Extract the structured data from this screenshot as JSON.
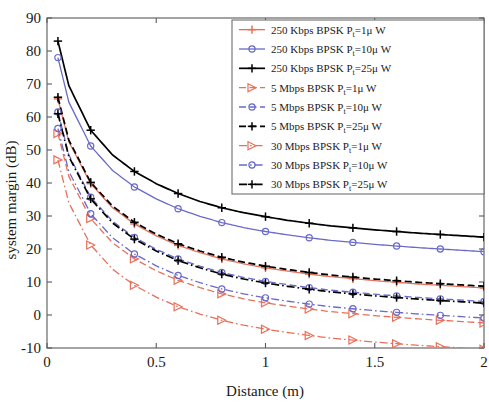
{
  "chart_data": {
    "type": "line",
    "title": "",
    "xlabel": "Distance (m)",
    "ylabel": "system margin (dB)",
    "xlim": [
      0,
      2
    ],
    "ylim": [
      -10,
      90
    ],
    "xticks": [
      0,
      0.5,
      1,
      1.5,
      2
    ],
    "xticklabels": [
      "0",
      "0.5",
      "1",
      "1.5",
      "2"
    ],
    "yticks": [
      -10,
      0,
      10,
      20,
      30,
      40,
      50,
      60,
      70,
      80,
      90
    ],
    "yticklabels": [
      "-10",
      "0",
      "10",
      "20",
      "30",
      "40",
      "50",
      "60",
      "70",
      "80",
      "90"
    ],
    "grid": false,
    "legend_position": "upper right",
    "x": [
      0.05,
      0.1,
      0.2,
      0.3,
      0.4,
      0.5,
      0.6,
      0.7,
      0.8,
      0.9,
      1.0,
      1.1,
      1.2,
      1.3,
      1.4,
      1.5,
      1.6,
      1.7,
      1.8,
      1.9,
      2.0
    ],
    "series": [
      {
        "name": "250 Kbps BPSK Pt=25μ W",
        "rate": "250 Kbps",
        "power": "25μ W",
        "color": "#000000",
        "linestyle": "solid",
        "marker": "plus",
        "values": [
          83.0,
          69.5,
          56.0,
          48.5,
          43.5,
          39.8,
          36.8,
          34.4,
          32.5,
          31.0,
          29.8,
          28.7,
          27.8,
          27.0,
          26.4,
          25.8,
          25.3,
          24.8,
          24.4,
          24.0,
          23.6
        ]
      },
      {
        "name": "250 Kbps BPSK Pt=10μ W",
        "rate": "250 Kbps",
        "power": "10μ W",
        "color": "#6a6ac8",
        "linestyle": "solid",
        "marker": "circle",
        "values": [
          78.0,
          64.5,
          51.2,
          43.8,
          38.8,
          35.2,
          32.2,
          29.9,
          28.0,
          26.5,
          25.3,
          24.3,
          23.4,
          22.6,
          22.0,
          21.4,
          20.9,
          20.4,
          20.0,
          19.6,
          19.2
        ]
      },
      {
        "name": "250 Kbps BPSK Pt=1μ W",
        "rate": "250 Kbps",
        "power": "1μ W",
        "color": "#e8705a",
        "linestyle": "solid",
        "marker": "plus",
        "values": [
          65.5,
          52.5,
          39.8,
          32.5,
          27.6,
          24.0,
          21.1,
          18.9,
          17.0,
          15.5,
          14.3,
          13.3,
          12.4,
          11.6,
          11.0,
          10.4,
          9.9,
          9.4,
          9.0,
          8.6,
          8.2
        ]
      },
      {
        "name": "5 Mbps BPSK Pt=25μ W",
        "rate": "5 Mbps",
        "power": "25μ W",
        "color": "#000000",
        "linestyle": "dashed",
        "marker": "plus",
        "values": [
          66.0,
          53.0,
          40.2,
          33.0,
          28.1,
          24.5,
          21.6,
          19.4,
          17.5,
          16.0,
          14.8,
          13.8,
          12.9,
          12.1,
          11.5,
          10.9,
          10.4,
          9.9,
          9.5,
          9.1,
          8.7
        ]
      },
      {
        "name": "5 Mbps BPSK Pt=10μ W",
        "rate": "5 Mbps",
        "power": "10μ W",
        "color": "#6a6ac8",
        "linestyle": "dashed",
        "marker": "circle",
        "values": [
          61.5,
          48.5,
          35.7,
          28.4,
          23.5,
          19.9,
          17.0,
          14.8,
          12.9,
          11.4,
          10.2,
          9.2,
          8.3,
          7.5,
          6.9,
          6.3,
          5.8,
          5.3,
          4.9,
          4.5,
          4.1
        ]
      },
      {
        "name": "5 Mbps BPSK Pt=1μ W",
        "rate": "5 Mbps",
        "power": "1μ W",
        "color": "#e8705a",
        "linestyle": "dashed",
        "marker": "triangle-right",
        "values": [
          55.0,
          42.0,
          29.2,
          21.9,
          17.0,
          13.4,
          10.5,
          8.3,
          6.4,
          4.9,
          3.7,
          2.7,
          1.8,
          1.0,
          0.4,
          -0.2,
          -0.7,
          -1.2,
          -1.6,
          -2.0,
          -2.4
        ]
      },
      {
        "name": "30 Mbps BPSK Pt=25μ W",
        "rate": "30 Mbps",
        "power": "25μ W",
        "color": "#000000",
        "linestyle": "dashdot",
        "marker": "plus",
        "values": [
          61.0,
          48.0,
          35.2,
          27.9,
          23.0,
          19.4,
          16.5,
          14.3,
          12.4,
          10.9,
          9.7,
          8.7,
          7.8,
          7.0,
          6.4,
          5.8,
          5.3,
          4.8,
          4.4,
          4.0,
          3.6
        ]
      },
      {
        "name": "30 Mbps BPSK Pt=10μ W",
        "rate": "30 Mbps",
        "power": "10μ W",
        "color": "#6a6ac8",
        "linestyle": "dashdot",
        "marker": "circle",
        "values": [
          56.5,
          43.5,
          30.7,
          23.4,
          18.5,
          14.9,
          12.0,
          9.8,
          7.9,
          6.4,
          5.2,
          4.2,
          3.3,
          2.5,
          1.9,
          1.3,
          0.8,
          0.3,
          -0.1,
          -0.5,
          -0.9
        ]
      },
      {
        "name": "30 Mbps BPSK Pt=1μ W",
        "rate": "30 Mbps",
        "power": "1μ W",
        "color": "#e8705a",
        "linestyle": "dashdot",
        "marker": "triangle-right",
        "values": [
          47.0,
          34.0,
          21.2,
          13.9,
          9.0,
          5.4,
          2.5,
          0.3,
          -1.6,
          -3.1,
          -4.3,
          -5.3,
          -6.2,
          -7.0,
          -7.6,
          -8.2,
          -8.7,
          -9.2,
          -9.6,
          -10.0,
          -10.4
        ]
      }
    ],
    "legend_entries": [
      {
        "rate": "250 Kbps",
        "modulation": "BPSK",
        "param": "P",
        "sub": "t",
        "eq": "=1",
        "unit": "μ W",
        "color": "#e8705a",
        "linestyle": "solid",
        "marker": "plus"
      },
      {
        "rate": "250 Kbps",
        "modulation": "BPSK",
        "param": "P",
        "sub": "t",
        "eq": "=10",
        "unit": "μ W",
        "color": "#6a6ac8",
        "linestyle": "solid",
        "marker": "circle"
      },
      {
        "rate": "250 Kbps",
        "modulation": "BPSK",
        "param": "P",
        "sub": "t",
        "eq": "=25",
        "unit": "μ W",
        "color": "#000000",
        "linestyle": "solid",
        "marker": "plus"
      },
      {
        "rate": "5 Mbps",
        "modulation": "BPSK",
        "param": "P",
        "sub": "t",
        "eq": "=1",
        "unit": "μ W",
        "color": "#e8705a",
        "linestyle": "dashed",
        "marker": "triangle-right"
      },
      {
        "rate": "5 Mbps",
        "modulation": "BPSK",
        "param": "P",
        "sub": "t",
        "eq": "=10",
        "unit": "μ W",
        "color": "#6a6ac8",
        "linestyle": "dashed",
        "marker": "circle"
      },
      {
        "rate": "5 Mbps",
        "modulation": "BPSK",
        "param": "P",
        "sub": "t",
        "eq": "=25",
        "unit": "μ W",
        "color": "#000000",
        "linestyle": "dashed",
        "marker": "plus"
      },
      {
        "rate": "30 Mbps",
        "modulation": "BPSK",
        "param": "P",
        "sub": "t",
        "eq": "=1",
        "unit": "μ W",
        "color": "#e8705a",
        "linestyle": "dashdot",
        "marker": "triangle-right"
      },
      {
        "rate": "30 Mbps",
        "modulation": "BPSK",
        "param": "P",
        "sub": "t",
        "eq": "=10",
        "unit": "μ W",
        "color": "#6a6ac8",
        "linestyle": "dashdot",
        "marker": "circle"
      },
      {
        "rate": "30 Mbps",
        "modulation": "BPSK",
        "param": "P",
        "sub": "t",
        "eq": "=25",
        "unit": "μ W",
        "color": "#000000",
        "linestyle": "dashdot",
        "marker": "plus"
      }
    ]
  },
  "colors": {
    "axis": "#5a5a5a",
    "text": "#1a1a1a",
    "black_series": "#000000",
    "blue_series": "#6a6ac8",
    "red_series": "#e8705a",
    "background": "#ffffff",
    "legend_border": "#6e6e6e"
  }
}
